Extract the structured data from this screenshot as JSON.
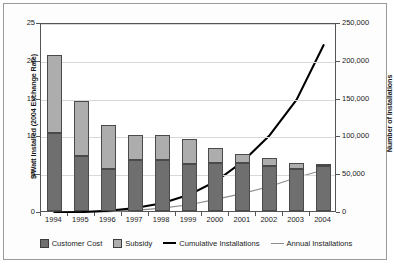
{
  "chart_data": {
    "type": "bar",
    "title": "",
    "subtitle": "",
    "xlabel": "",
    "ylabel": "$/Watt Installed (2004 Exchange Rate)",
    "y2label": "Number of Installations",
    "categories": [
      "1994",
      "1995",
      "1996",
      "1997",
      "1998",
      "1999",
      "2000",
      "2001",
      "2002",
      "2003",
      "2004"
    ],
    "ylim": [
      0,
      25
    ],
    "yticks": [
      "0",
      "5",
      "10",
      "15",
      "20",
      "25"
    ],
    "y2lim": [
      0,
      250000
    ],
    "y2ticks": [
      "0",
      "50,000",
      "100,000",
      "150,000",
      "200,000",
      "250,000"
    ],
    "grid": true,
    "legend_position": "bottom",
    "series": [
      {
        "name": "Customer Cost",
        "type": "bar",
        "stack": "cost",
        "axis": "left",
        "color": "#6f6f6f",
        "values": [
          10.3,
          7.3,
          5.6,
          6.8,
          6.8,
          6.2,
          6.3,
          6.4,
          6.0,
          5.5,
          5.9
        ]
      },
      {
        "name": "Subsidy",
        "type": "bar",
        "stack": "cost",
        "axis": "left",
        "color": "#adadad",
        "values": [
          10.4,
          7.3,
          5.8,
          3.2,
          3.2,
          3.3,
          2.1,
          1.1,
          1.0,
          0.8,
          0.3
        ]
      },
      {
        "name": "Cumulative Installations",
        "type": "line",
        "axis": "right",
        "color": "#000000",
        "values": [
          200,
          1200,
          3000,
          6500,
          13000,
          24000,
          42000,
          68000,
          103000,
          150000,
          222000
        ]
      },
      {
        "name": "Annual Installations",
        "type": "line",
        "axis": "right",
        "color": "#8d8d8d",
        "values": [
          200,
          1000,
          1800,
          3500,
          6500,
          11000,
          18000,
          26000,
          35000,
          47000,
          57000
        ]
      }
    ],
    "bar_totals": [
      20.7,
      14.6,
      11.4,
      10.0,
      10.0,
      9.5,
      8.4,
      7.5,
      7.0,
      6.3,
      6.2
    ]
  },
  "legend": {
    "items": [
      {
        "label": "Customer Cost",
        "marker": "square-swatch-icon"
      },
      {
        "label": "Subsidy",
        "marker": "square-swatch-icon"
      },
      {
        "label": "Cumulative Installations",
        "marker": "thick-line-icon"
      },
      {
        "label": "Annual Installations",
        "marker": "thin-line-icon"
      }
    ]
  }
}
